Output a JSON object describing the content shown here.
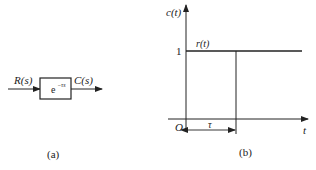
{
  "figure_a": {
    "input_label": "R(s)",
    "output_label": "C(s)",
    "block_base": "e",
    "block_exponent": "−τs",
    "caption": "(a)"
  },
  "figure_b": {
    "y_axis_label": "c(t)",
    "x_axis_label": "t",
    "origin_label": "O",
    "level_label": "1",
    "curve_label": "r(t)",
    "delay_label": "τ",
    "caption": "(b)"
  },
  "colors": {
    "line": "#222222",
    "background": "#ffffff"
  }
}
